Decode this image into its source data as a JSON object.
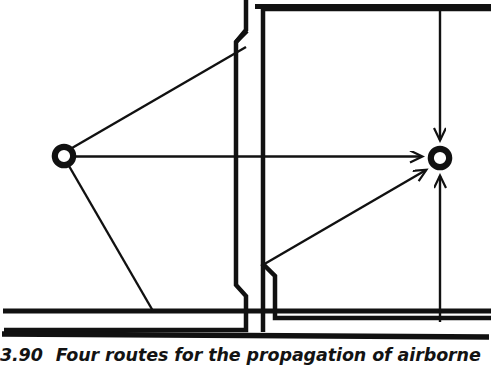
{
  "figure": {
    "caption_number": "3.90",
    "caption_text": "Four routes for the propagation of airborne",
    "stroke_color": "#111111",
    "background_color": "#ffffff",
    "width": 491,
    "height": 370
  },
  "diagram": {
    "type": "architectural-floor-plan-section",
    "nodes": [
      {
        "id": "source",
        "name": "sound-source",
        "shape": "circle",
        "cx": 64,
        "cy": 156,
        "r": 9.5,
        "stroke_width": 6
      },
      {
        "id": "receiver",
        "name": "sound-receiver",
        "shape": "circle",
        "cx": 440,
        "cy": 158,
        "r": 9.5,
        "stroke_width": 6
      }
    ],
    "routes": [
      {
        "id": "route-direct",
        "label": "direct transmission through partition",
        "path": "M 76 156 L 424 156",
        "arrowhead": "end"
      },
      {
        "id": "route-over-ceiling",
        "label": "flanking over partition via ceiling void",
        "path": "M 71 149 L 246 47",
        "arrowhead": "none"
      },
      {
        "id": "route-under-floor",
        "label": "flanking under partition via floor void",
        "path": "M 69 165 L 152 310",
        "arrowhead": "none"
      },
      {
        "id": "route-from-floor-void",
        "label": "flanking up from floor void to receiver",
        "path": "M 262 266 L 428 170",
        "arrowhead": "end"
      },
      {
        "id": "route-down-from-ceiling",
        "label": "down from ceiling void to receiver",
        "path": "M 440 8 L 440 142",
        "arrowhead": "end"
      },
      {
        "id": "route-up-from-floor",
        "label": "up from floor void to receiver",
        "path": "M 440 320 L 440 174",
        "arrowhead": "end"
      }
    ],
    "walls": [
      {
        "id": "ceiling-slab-top",
        "name": "top-slab-line",
        "path": "M 257 6 L 491 6"
      },
      {
        "id": "ceiling-void-underside",
        "name": "suspended-ceiling-line",
        "path": "M 260 8 L 260 45"
      },
      {
        "id": "partition-left-face",
        "name": "partition-left-face",
        "path": "M 248 0 L 248 33 L 238 44 L 238 283 L 248 294 L 248 330 L 5 330"
      },
      {
        "id": "partition-right-face",
        "name": "partition-right-face",
        "path": "M 263 0 L 263 266 L 275 278 L 275 318 L 491 318"
      },
      {
        "id": "floor-slab-line",
        "name": "floor-line-upper",
        "path": "M 5 311 L 491 311"
      },
      {
        "id": "floor-slab-bottom",
        "name": "floor-line-lower",
        "path": "M 3 334 L 488 336"
      },
      {
        "id": "room-right-ceiling",
        "name": "right-room-ceiling",
        "path": "M 265 8 L 491 8"
      }
    ]
  }
}
